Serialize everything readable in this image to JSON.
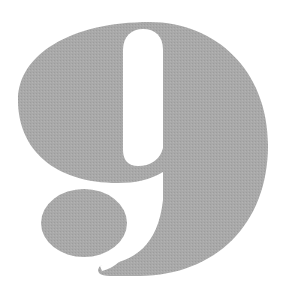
{
  "figure": {
    "glyph": "9",
    "fill_color": "#a9a9a9",
    "texture_color": "#9e9e9e",
    "background_color": "#ffffff"
  }
}
